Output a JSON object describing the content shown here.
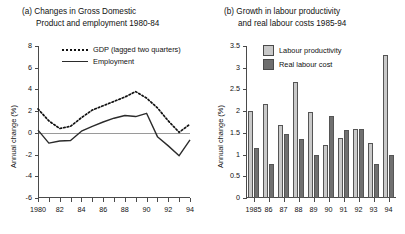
{
  "chart_data": [
    {
      "type": "line",
      "panel": "a",
      "title_line1": "(a) Changes in Gross Domestic",
      "title_line2": "Product and employment 1980-84",
      "ylabel": "Annual change (%)",
      "xlabel": "",
      "ylim": [
        -6,
        8
      ],
      "yticks": [
        -6,
        -4,
        -2,
        0,
        2,
        4,
        6,
        8
      ],
      "yticklabels": [
        "-6",
        "-4",
        "-2",
        "0",
        "2",
        "4",
        "6",
        "8"
      ],
      "xlim": [
        1980,
        1994
      ],
      "x": [
        1980,
        1981,
        1982,
        1983,
        1984,
        1985,
        1986,
        1987,
        1988,
        1989,
        1990,
        1991,
        1992,
        1993,
        1994
      ],
      "xticklabels": [
        "1980",
        "",
        "82",
        "",
        "84",
        "",
        "86",
        "",
        "88",
        "",
        "90",
        "",
        "92",
        "",
        "94"
      ],
      "grid": false,
      "legend_position": "upper-center",
      "series": [
        {
          "name": "GDP (lagged two quarters)",
          "style": "dotted",
          "color": "#111111",
          "values": [
            2.2,
            1.1,
            0.4,
            0.6,
            1.4,
            2.1,
            2.5,
            2.9,
            3.3,
            3.8,
            3.2,
            2.3,
            1.1,
            0.05,
            0.8
          ]
        },
        {
          "name": "Employment",
          "style": "solid",
          "color": "#2b2b2b",
          "values": [
            0.25,
            -0.95,
            -0.75,
            -0.7,
            0.15,
            0.6,
            1.0,
            1.35,
            1.6,
            1.5,
            1.8,
            -0.35,
            -1.2,
            -2.1,
            -0.65
          ]
        }
      ]
    },
    {
      "type": "bar",
      "panel": "b",
      "title_line1": "(b) Growth in labour productivity",
      "title_line2": "and real labour costs 1985-94",
      "ylabel": "Annual change (%)",
      "xlabel": "",
      "ylim": [
        0,
        3.5
      ],
      "yticks": [
        0,
        0.5,
        1,
        1.5,
        2,
        2.5,
        3,
        3.5
      ],
      "yticklabels": [
        "0",
        "0.5",
        "1",
        "1.5",
        "2",
        "2.5",
        "3",
        "3.5"
      ],
      "categories": [
        "1985",
        "86",
        "87",
        "88",
        "89",
        "90",
        "91",
        "92",
        "93",
        "94"
      ],
      "grid": false,
      "legend_position": "upper-left",
      "series": [
        {
          "name": "Labour productivity",
          "color": "#c9c9c9",
          "values": [
            2.01,
            2.17,
            1.68,
            2.66,
            1.98,
            1.21,
            1.39,
            1.59,
            1.26,
            3.29
          ]
        },
        {
          "name": "Real labour cost",
          "color": "#707070",
          "values": [
            1.16,
            0.79,
            1.47,
            1.35,
            0.98,
            1.88,
            1.56,
            1.6,
            0.78,
            0.99
          ]
        }
      ]
    }
  ]
}
